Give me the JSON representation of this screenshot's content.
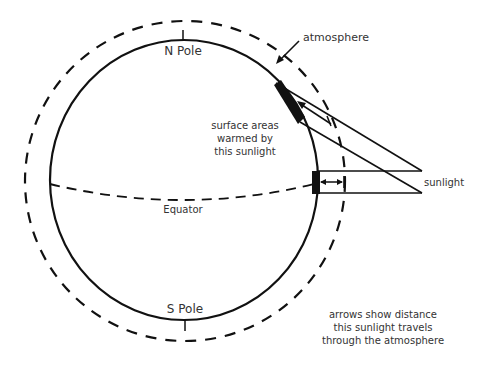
{
  "diagram": {
    "labels": {
      "atmosphere": "atmosphere",
      "north_pole": "N Pole",
      "south_pole": "S Pole",
      "equator": "Equator",
      "sunlight": "sunlight",
      "surface_areas": [
        "surface areas",
        "warmed by",
        "this sunlight"
      ],
      "arrows_note": [
        "arrows show distance",
        "this sunlight travels",
        "through the atmosphere"
      ]
    },
    "colors": {
      "stroke": "#111111",
      "text": "#333333",
      "background": "#ffffff"
    }
  }
}
